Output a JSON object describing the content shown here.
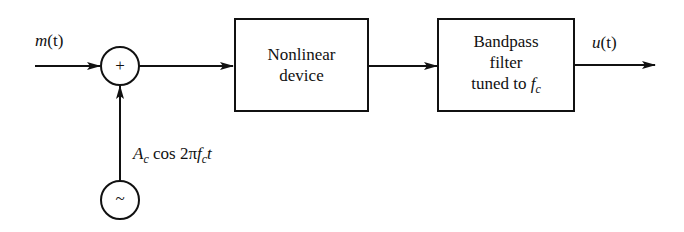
{
  "diagram": {
    "type": "block-diagram",
    "input": {
      "signal": "m",
      "arg": "(t)"
    },
    "summer": {
      "symbol": "+"
    },
    "oscillator": {
      "symbol": "~",
      "label_amp": "A",
      "label_amp_sub": "c",
      "label_func": " cos 2π",
      "label_freq": "f",
      "label_freq_sub": "c",
      "label_var": "t"
    },
    "blocks": [
      {
        "line1": "Nonlinear",
        "line2": "device"
      },
      {
        "line1": "Bandpass",
        "line2": "filter",
        "line3_text": "tuned to ",
        "line3_freq": "f",
        "line3_freq_sub": "c"
      }
    ],
    "output": {
      "signal": "u",
      "arg": "(t)"
    },
    "colors": {
      "stroke": "#111111",
      "background": "#ffffff"
    }
  }
}
